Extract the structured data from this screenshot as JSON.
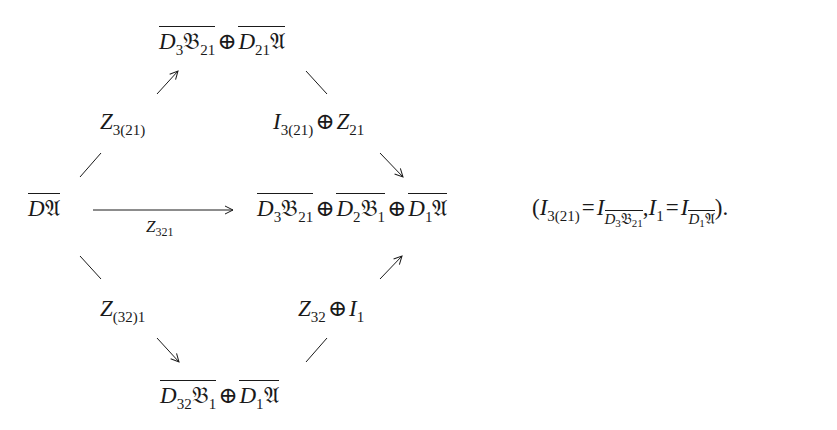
{
  "diagram": {
    "type": "commutative-diagram",
    "nodes": {
      "left": {
        "id": "DA",
        "latex": "\\overline{D\\mathfrak{A}}",
        "parts": {
          "D": "D",
          "frak": "𝔄"
        }
      },
      "top": {
        "id": "D3B21+D21A",
        "latex": "\\overline{D_3\\mathfrak{B}_{21}} \\oplus \\overline{D_{21}\\mathfrak{A}}",
        "t1": {
          "D": "D",
          "dsub": "3",
          "frak": "𝔅",
          "fsub": "21"
        },
        "op": "⊕",
        "t2": {
          "D": "D",
          "dsub": "21",
          "frak": "𝔄"
        }
      },
      "center": {
        "id": "D3B21+D2B1+D1A",
        "latex": "\\overline{D_3\\mathfrak{B}_{21}} \\oplus \\overline{D_2\\mathfrak{B}_1} \\oplus \\overline{D_1\\mathfrak{A}}",
        "t1": {
          "D": "D",
          "dsub": "3",
          "frak": "𝔅",
          "fsub": "21"
        },
        "op": "⊕",
        "t2": {
          "D": "D",
          "dsub": "2",
          "frak": "𝔅",
          "fsub": "1"
        },
        "t3": {
          "D": "D",
          "dsub": "1",
          "frak": "𝔄"
        }
      },
      "bottom": {
        "id": "D32B1+D1A",
        "latex": "\\overline{D_{32}\\mathfrak{B}_1} \\oplus \\overline{D_1\\mathfrak{A}}",
        "t1": {
          "D": "D",
          "dsub": "32",
          "frak": "𝔅",
          "fsub": "1"
        },
        "op": "⊕",
        "t2": {
          "D": "D",
          "dsub": "1",
          "frak": "𝔄"
        }
      }
    },
    "edges": [
      {
        "from": "left",
        "to": "top",
        "label": {
          "main": "Z",
          "sub": "3(21)"
        },
        "latex": "Z_{3(21)}"
      },
      {
        "from": "top",
        "to": "center",
        "label": {
          "a": "I",
          "asub": "3(21)",
          "op": "⊕",
          "b": "Z",
          "bsub": "21"
        },
        "latex": "I_{3(21)} \\oplus Z_{21}"
      },
      {
        "from": "left",
        "to": "center",
        "label": {
          "main": "Z",
          "sub": "321"
        },
        "latex": "Z_{321}"
      },
      {
        "from": "left",
        "to": "bottom",
        "label": {
          "main": "Z",
          "sub": "(32)1"
        },
        "latex": "Z_{(32)1}"
      },
      {
        "from": "bottom",
        "to": "center",
        "label": {
          "a": "Z",
          "asub": "32",
          "op": "⊕",
          "b": "I",
          "bsub": "1"
        },
        "latex": "Z_{32} \\oplus I_1"
      }
    ],
    "note": {
      "latex": "(I_{3(21)} = I_{\\overline{D_3\\mathfrak{B}_{21}}}, I_1 = I_{\\overline{D_1\\mathfrak{A}}}).",
      "open": "(",
      "i1": "I",
      "i1sub": "3(21)",
      "eq": "=",
      "i2": "I",
      "i2sub": {
        "D": "D",
        "dsub": "3",
        "frak": "𝔅",
        "fsub": "21"
      },
      "comma": ",",
      "i3": "I",
      "i3sub": "1",
      "eq2": "=",
      "i4": "I",
      "i4sub": {
        "D": "D",
        "dsub": "1",
        "frak": "𝔄"
      },
      "close": ")."
    }
  }
}
